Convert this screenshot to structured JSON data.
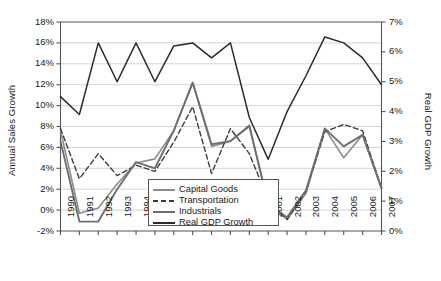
{
  "chart_data": {
    "type": "line",
    "title": "",
    "xlabel": "",
    "ylabel": "Annual Sales Growth",
    "y2label": "Real GDP Growth",
    "grid": true,
    "legend_position": "inside-bottom-center",
    "categories": [
      "1990",
      "1991",
      "1992",
      "1993",
      "1994",
      "1995",
      "1996",
      "1997",
      "1998",
      "1999",
      "2000",
      "2001",
      "2002",
      "2003",
      "2004",
      "2005",
      "2006",
      "2007"
    ],
    "ylim": [
      -2,
      18
    ],
    "yticks": [
      "-2%",
      "0%",
      "2%",
      "4%",
      "6%",
      "8%",
      "10%",
      "12%",
      "14%",
      "16%",
      "18%"
    ],
    "y2lim": [
      0,
      7
    ],
    "y2ticks": [
      "0%",
      "1%",
      "2%",
      "3%",
      "4%",
      "5%",
      "6%",
      "7%"
    ],
    "series": [
      {
        "name": "Capital Goods",
        "axis": "left",
        "style": "solid",
        "color": "#8c8c8c",
        "width": 1.6,
        "values": [
          7.6,
          -0.3,
          0.2,
          2.5,
          4.5,
          4.9,
          7.6,
          12.2,
          6.1,
          6.6,
          8.0,
          0.6,
          -0.9,
          1.6,
          7.8,
          5.0,
          7.2,
          2.1
        ]
      },
      {
        "name": "Transportation",
        "axis": "left",
        "style": "dashed",
        "color": "#3d3d3d",
        "width": 1.4,
        "values": [
          7.8,
          3.0,
          5.4,
          3.3,
          4.3,
          3.7,
          6.5,
          9.9,
          3.5,
          7.8,
          5.4,
          1.0,
          -0.9,
          1.8,
          7.5,
          8.2,
          7.6,
          2.1
        ]
      },
      {
        "name": "Industrials",
        "axis": "left",
        "style": "solid",
        "color": "#6e6e6e",
        "width": 1.9,
        "values": [
          6.6,
          -1.1,
          -1.1,
          2.0,
          4.6,
          4.0,
          7.6,
          12.2,
          6.3,
          6.6,
          8.1,
          0.6,
          -0.7,
          1.9,
          7.8,
          6.1,
          7.2,
          2.1
        ]
      },
      {
        "name": "Real GDP Growth",
        "axis": "right",
        "style": "solid",
        "color": "#2b2b2b",
        "width": 1.5,
        "values": [
          4.5,
          3.9,
          6.3,
          5.0,
          6.3,
          5.0,
          6.2,
          6.3,
          5.8,
          6.3,
          3.8,
          2.4,
          4.0,
          5.2,
          6.5,
          6.3,
          5.8,
          4.9
        ]
      }
    ]
  },
  "legend": {
    "items": [
      {
        "label": "Capital Goods"
      },
      {
        "label": "Transportation"
      },
      {
        "label": "Industrials"
      },
      {
        "label": "Real GDP Growth"
      }
    ]
  }
}
